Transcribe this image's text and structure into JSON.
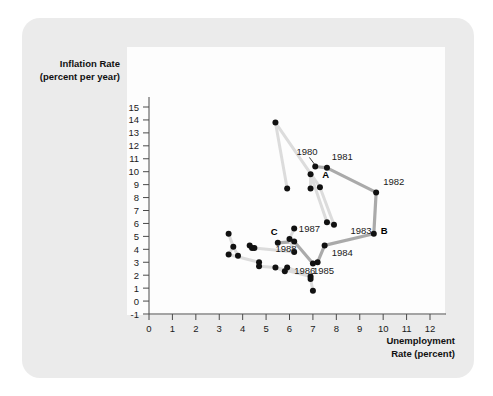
{
  "figure": {
    "background_color": "#ebebeb",
    "plot_background_color": "#fdfdfd"
  },
  "axes": {
    "y_title_line1": "Inflation Rate",
    "y_title_line2": "(percent per year)",
    "x_title_line1": "Unemployment",
    "x_title_line2": "Rate (percent)",
    "x_ticks": [
      "0",
      "1",
      "2",
      "3",
      "4",
      "5",
      "6",
      "7",
      "8",
      "9",
      "10",
      "11",
      "12"
    ],
    "y_ticks": [
      "15",
      "14",
      "13",
      "12",
      "11",
      "10",
      "9",
      "8",
      "7",
      "6",
      "5",
      "4",
      "3",
      "2",
      "1",
      "0",
      "-1"
    ]
  },
  "chart_data": {
    "type": "scatter",
    "title": "",
    "xlabel": "Unemployment Rate (percent)",
    "ylabel": "Inflation Rate (percent per year)",
    "xlim": [
      0,
      12.6
    ],
    "ylim": [
      -1,
      15.4
    ],
    "grid": false,
    "legend": "none",
    "marker_color": "#111111",
    "connector_color_dark": "#aaaaaa",
    "connector_color_light": "#dcdcdc",
    "series": [
      {
        "name": "highlighted-path-1980-1988",
        "connector": "dark",
        "points": [
          {
            "x": 7.1,
            "y": 10.4,
            "label": "1980",
            "label_pos": "upper-left",
            "marker_label": "A"
          },
          {
            "x": 7.6,
            "y": 10.3,
            "label": "1981",
            "label_pos": "right"
          },
          {
            "x": 9.7,
            "y": 8.4,
            "label": "1982",
            "label_pos": "right"
          },
          {
            "x": 9.6,
            "y": 5.2,
            "label": "1983",
            "label_pos": "left",
            "marker_label": "B"
          },
          {
            "x": 7.5,
            "y": 4.3,
            "label": "1984",
            "label_pos": "lower-right"
          },
          {
            "x": 7.2,
            "y": 3.0,
            "label": "1985",
            "label_pos": "below"
          },
          {
            "x": 7.0,
            "y": 2.9,
            "label": "1986",
            "label_pos": "below-left"
          },
          {
            "x": 6.2,
            "y": 4.6,
            "label": "1987",
            "label_pos": "upper-right"
          },
          {
            "x": 5.5,
            "y": 4.5,
            "label": "1988",
            "label_pos": "below",
            "marker_label": "C"
          }
        ]
      },
      {
        "name": "background-scatter",
        "connector": "light",
        "points": [
          {
            "x": 5.4,
            "y": 13.8
          },
          {
            "x": 5.9,
            "y": 8.7
          },
          {
            "x": 6.9,
            "y": 9.8
          },
          {
            "x": 6.9,
            "y": 8.7
          },
          {
            "x": 7.3,
            "y": 8.8
          },
          {
            "x": 7.6,
            "y": 6.1
          },
          {
            "x": 7.9,
            "y": 5.9
          },
          {
            "x": 6.2,
            "y": 5.6
          },
          {
            "x": 6.0,
            "y": 4.8
          },
          {
            "x": 6.2,
            "y": 3.8
          },
          {
            "x": 3.4,
            "y": 5.2
          },
          {
            "x": 3.6,
            "y": 4.2
          },
          {
            "x": 3.4,
            "y": 3.6
          },
          {
            "x": 3.8,
            "y": 3.5
          },
          {
            "x": 4.3,
            "y": 4.3
          },
          {
            "x": 4.4,
            "y": 4.1
          },
          {
            "x": 4.5,
            "y": 4.1
          },
          {
            "x": 4.7,
            "y": 3.0
          },
          {
            "x": 4.7,
            "y": 2.7
          },
          {
            "x": 5.4,
            "y": 2.6
          },
          {
            "x": 5.8,
            "y": 2.3
          },
          {
            "x": 5.9,
            "y": 2.6
          },
          {
            "x": 6.9,
            "y": 1.9
          },
          {
            "x": 6.9,
            "y": 1.7
          },
          {
            "x": 7.0,
            "y": 0.8
          }
        ]
      }
    ],
    "annotations": [
      {
        "text": "1980",
        "x": 6.3,
        "y": 11.3
      },
      {
        "text": "1981",
        "x": 7.8,
        "y": 10.9
      },
      {
        "text": "A",
        "x": 7.4,
        "y": 9.5
      },
      {
        "text": "1982",
        "x": 10.0,
        "y": 9.0
      },
      {
        "text": "1983",
        "x": 8.6,
        "y": 5.2
      },
      {
        "text": "B",
        "x": 9.9,
        "y": 5.2
      },
      {
        "text": "1984",
        "x": 7.8,
        "y": 3.5
      },
      {
        "text": "1985",
        "x": 7.0,
        "y": 2.1
      },
      {
        "text": "1986",
        "x": 6.2,
        "y": 2.1
      },
      {
        "text": "1987",
        "x": 6.4,
        "y": 5.3
      },
      {
        "text": "C",
        "x": 5.2,
        "y": 5.1
      },
      {
        "text": "1988",
        "x": 5.4,
        "y": 3.8
      }
    ]
  }
}
